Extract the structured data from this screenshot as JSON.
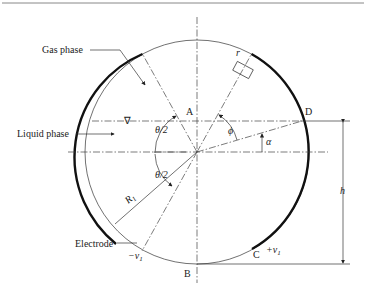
{
  "diagram": {
    "labels": {
      "gas_phase": "Gas phase",
      "liquid_phase": "Liquid phase",
      "electrode": "Electrode",
      "point_a": "A",
      "point_b": "B",
      "point_c": "C",
      "point_d": "D",
      "r": "r",
      "theta_half_top": "θ/2",
      "theta_half_bottom": "θ/2",
      "phi": "ϕ",
      "alpha": "α",
      "h": "h",
      "R1": "R",
      "R1_sub": "1",
      "minus_v1": "−v",
      "minus_v1_sub": "1",
      "plus_v1": "+v",
      "plus_v1_sub": "1",
      "liquid_level_symbol": "∇"
    },
    "colors": {
      "line": "#333333",
      "electrode": "#111111",
      "background": "#ffffff"
    }
  }
}
